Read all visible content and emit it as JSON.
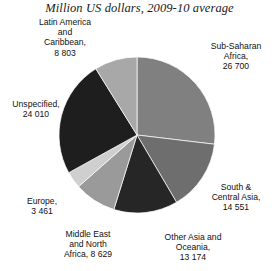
{
  "chart_data": {
    "type": "pie",
    "title": "Million US dollars, 2009-10 average",
    "xlabel": "",
    "ylabel": "",
    "units": "Million US dollars",
    "period": "2009-10 average",
    "total": 99328,
    "legend_position": "outside-labels",
    "grid": false,
    "start_angle_deg": 0,
    "direction": "clockwise",
    "categories": [
      "Sub-Saharan Africa",
      "South & Central Asia",
      "Other Asia and Oceania",
      "Middle East and North Africa",
      "Europe",
      "Unspecified",
      "Latin America and Caribbean"
    ],
    "values": [
      26700,
      14551,
      13174,
      8629,
      3461,
      24010,
      8803
    ],
    "colors": [
      "#808080",
      "#6e6e6e",
      "#262626",
      "#9a9a9a",
      "#cfcfcf",
      "#1e1e1e",
      "#a8a8a8"
    ],
    "slices": [
      {
        "name": "Sub-Saharan Africa",
        "value": 26700,
        "value_text": "26 700",
        "label_text": "Sub-Saharan\nAfrica,\n26 700",
        "color": "#808080",
        "start_deg": 0.0,
        "sweep_deg": 96.79
      },
      {
        "name": "South & Central Asia",
        "value": 14551,
        "value_text": "14 551",
        "label_text": "South &\nCentral Asia,\n14 551",
        "color": "#6e6e6e",
        "start_deg": 96.79,
        "sweep_deg": 52.74
      },
      {
        "name": "Other Asia and Oceania",
        "value": 13174,
        "value_text": "13 174",
        "label_text": "Other Asia and\nOceania,\n13 174",
        "color": "#262626",
        "start_deg": 149.53,
        "sweep_deg": 47.75
      },
      {
        "name": "Middle East and North Africa",
        "value": 8629,
        "value_text": "8 629",
        "label_text": "Middle East\nand North\nAfrica, 8 629",
        "color": "#9a9a9a",
        "start_deg": 197.28,
        "sweep_deg": 31.28
      },
      {
        "name": "Europe",
        "value": 3461,
        "value_text": "3 461",
        "label_text": "Europe,\n3 461",
        "color": "#cfcfcf",
        "start_deg": 228.56,
        "sweep_deg": 12.54
      },
      {
        "name": "Unspecified",
        "value": 24010,
        "value_text": "24 010",
        "label_text": "Unspecified,\n24 010",
        "color": "#1e1e1e",
        "start_deg": 241.1,
        "sweep_deg": 87.03
      },
      {
        "name": "Latin America and Caribbean",
        "value": 8803,
        "value_text": "8 803",
        "label_text": "Latin America\nand\nCaribbean,\n8 803",
        "color": "#a8a8a8",
        "start_deg": 328.13,
        "sweep_deg": 31.91
      }
    ],
    "geometry": {
      "center_x": 137,
      "center_y": 135,
      "radius": 78
    },
    "background_color": "#ffffff",
    "text_color": "#111111"
  }
}
